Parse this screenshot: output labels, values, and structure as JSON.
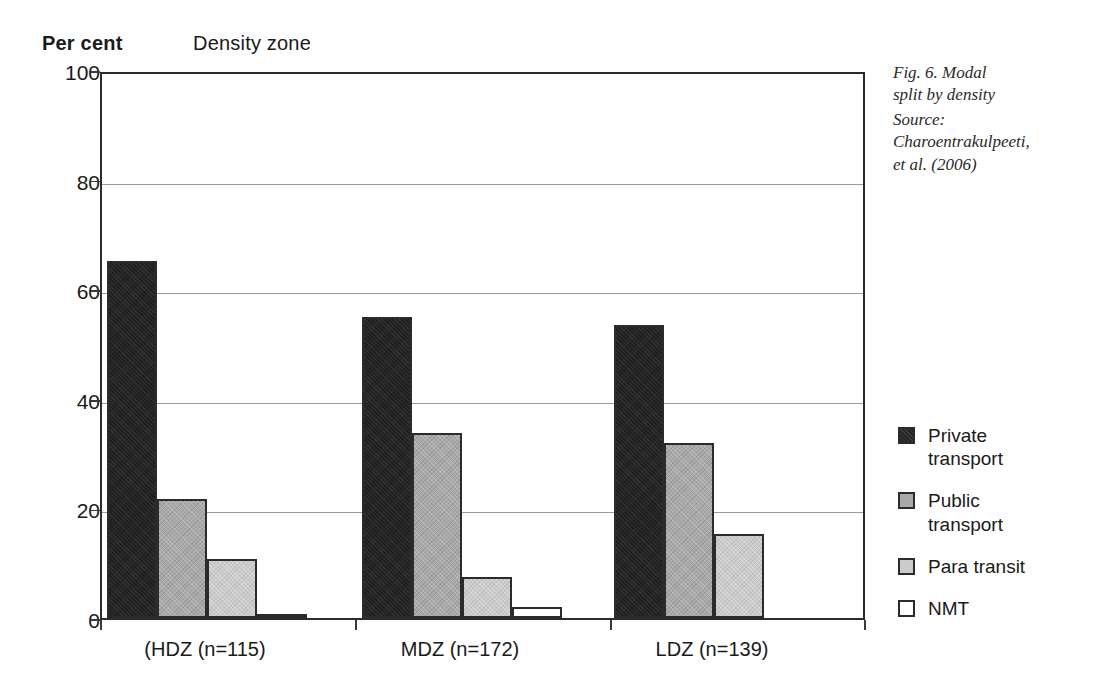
{
  "header": {
    "percent_label": "Per cent",
    "density_zone_label": "Density zone"
  },
  "caption": {
    "title": "Fig. 6. Modal\nsplit by density",
    "source_label": "Source:",
    "source_value": "Charoentrakulpeeti,\net al. (2006)"
  },
  "legend": {
    "items": [
      {
        "label": "Private\ntransport",
        "color": "#262626",
        "name": "private-transport"
      },
      {
        "label": "Public\ntransport",
        "color": "#a9a9a9",
        "name": "public-transport"
      },
      {
        "label": "Para transit",
        "color": "#cbcbcb",
        "name": "para-transit"
      },
      {
        "label": "NMT",
        "color": "#ffffff",
        "name": "nmt"
      }
    ]
  },
  "chart_data": {
    "type": "bar",
    "title": "Fig. 6. Modal split by density",
    "xlabel": "Density zone",
    "ylabel": "Per cent",
    "ylim": [
      0,
      100
    ],
    "yticks": [
      0,
      20,
      40,
      60,
      80,
      100
    ],
    "grid": true,
    "legend_position": "right",
    "categories": [
      "(HDZ (n=115)",
      "MDZ (n=172)",
      "LDZ (n=139)"
    ],
    "series": [
      {
        "name": "Private transport",
        "color": "#262626",
        "values": [
          65.2,
          55.0,
          53.5
        ]
      },
      {
        "name": "Public transport",
        "color": "#a9a9a9",
        "values": [
          21.7,
          33.7,
          32.0
        ]
      },
      {
        "name": "Para transit",
        "color": "#cbcbcb",
        "values": [
          10.8,
          7.5,
          15.4
        ]
      },
      {
        "name": "NMT",
        "color": "#ffffff",
        "values": [
          0.8,
          2.0,
          0.0
        ]
      }
    ]
  }
}
